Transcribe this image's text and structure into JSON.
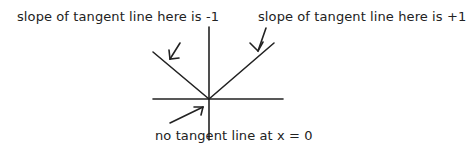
{
  "diagram": {
    "labels": {
      "left": "slope of tangent line here is -1",
      "right": "slope of tangent line here is +1",
      "bottom": "no tangent line at x = 0"
    },
    "graph": {
      "function": "y = |x|",
      "vertex": {
        "x": 0,
        "y": 0
      },
      "left_slope": -1,
      "right_slope": 1
    },
    "colors": {
      "line": "#222222",
      "background": "#ffffff"
    }
  }
}
